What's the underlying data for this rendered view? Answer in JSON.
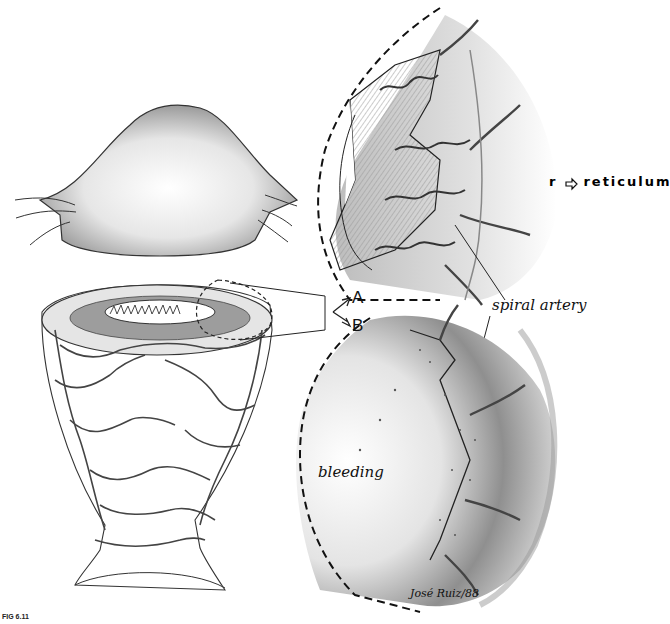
{
  "figure": {
    "caption": "FIG 6.11",
    "signature": "José Ruiz/88",
    "panels": [
      {
        "id": "uterus-exterior",
        "description": "external view of uterus with fallopian tubes and ligaments"
      },
      {
        "id": "uterus-section",
        "description": "uterus cut open showing endometrium with callout region"
      },
      {
        "id": "panel-a",
        "letter": "A",
        "description": "magnified endometrium section with spiral arteries"
      },
      {
        "id": "panel-b",
        "letter": "B",
        "description": "magnified endometrium section showing bleeding"
      }
    ],
    "labels": {
      "panel_a": "A",
      "panel_b": "B",
      "spiral_artery": "spiral artery",
      "bleeding": "bleeding"
    },
    "legend": {
      "symbol": "r",
      "icon": "arrow-right-outline-icon",
      "text": "reticulum"
    },
    "colors": {
      "background": "#ffffff",
      "ink": "#111111",
      "shade_light": "#d9d9d9",
      "shade_mid": "#9a9a9a",
      "shade_dark": "#555555"
    }
  }
}
